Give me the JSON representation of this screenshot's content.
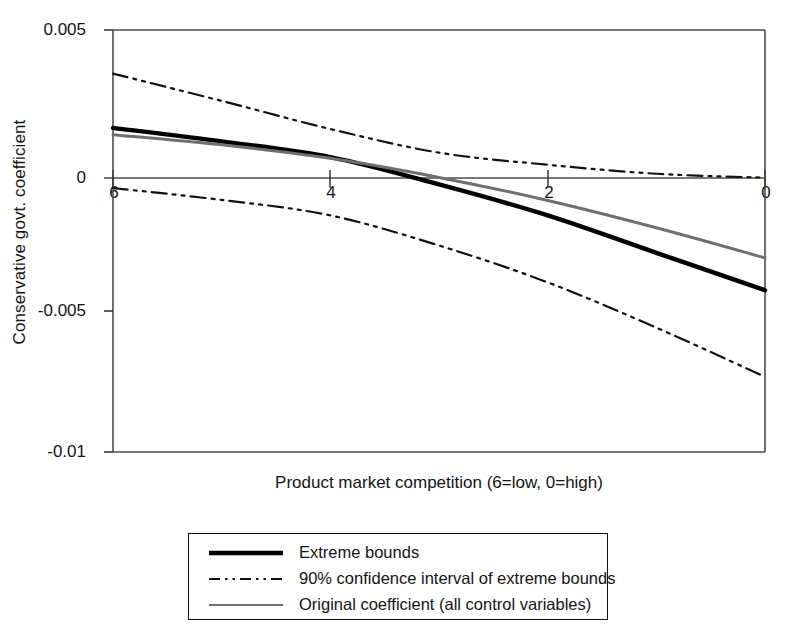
{
  "chart_data": {
    "type": "line",
    "title": "",
    "subtitle": "",
    "xlabel": "Product market competition (6=low, 0=high)",
    "ylabel": "Conservative govt. coefficient",
    "xlim": [
      6,
      0
    ],
    "ylim": [
      -0.01,
      0.005
    ],
    "x_ticks": [
      "6",
      "4",
      "2",
      "0"
    ],
    "x_tick_values": [
      6,
      4,
      2,
      0
    ],
    "y_ticks": [
      "0.005",
      "0",
      "-0.005",
      "-0.01"
    ],
    "y_tick_values": [
      0.005,
      0,
      -0.005,
      -0.01
    ],
    "x_axis_inverted": true,
    "grid": false,
    "zero_line": true,
    "legend_position": "below-plot",
    "x": [
      6,
      5,
      4,
      3,
      2,
      1,
      0
    ],
    "series": [
      {
        "name": "Extreme bounds",
        "style": "solid-thick",
        "color": "#000000",
        "values": [
          0.00152,
          0.00104,
          0.00048,
          -0.00049,
          -0.00159,
          -0.00292,
          -0.00425
        ]
      },
      {
        "name": "90% confidence interval of extreme bounds",
        "style": "dash-dot",
        "color": "#111111",
        "role": "upper",
        "values": [
          0.00345,
          0.00248,
          0.00148,
          0.00064,
          0.00021,
          -0.00011,
          -0.00025
        ]
      },
      {
        "name": "90% confidence interval of extreme bounds",
        "style": "dash-dot",
        "color": "#111111",
        "role": "lower",
        "values": [
          -0.00062,
          -0.00104,
          -0.00159,
          -0.00266,
          -0.00397,
          -0.00558,
          -0.00733
        ]
      },
      {
        "name": "Original coefficient (all control variables)",
        "style": "solid-thin-gray",
        "color": "#555555",
        "values": [
          0.00128,
          0.00092,
          0.00044,
          -0.00024,
          -0.00106,
          -0.00203,
          -0.0031
        ]
      }
    ],
    "legend": [
      {
        "label": "Extreme bounds",
        "style": "solid-thick"
      },
      {
        "label": "90% confidence interval of extreme bounds",
        "style": "dash-dot"
      },
      {
        "label": "Original coefficient (all control variables)",
        "style": "solid-thin-gray"
      }
    ]
  },
  "axes": {
    "y_label": "Conservative govt. coefficient",
    "x_label": "Product market competition (6=low, 0=high)",
    "y_tick_labels": [
      "0.005",
      "0",
      "-0.005",
      "-0.01"
    ],
    "x_tick_labels": [
      "6",
      "4",
      "2",
      "0"
    ]
  },
  "legend": {
    "items": [
      "Extreme bounds",
      "90% confidence interval of extreme bounds",
      "Original coefficient (all control variables)"
    ]
  },
  "colors": {
    "axis": "#4d4d4d",
    "extreme_bounds": "#000000",
    "confidence_interval": "#111111",
    "original_coefficient": "#555555",
    "background": "#ffffff"
  }
}
